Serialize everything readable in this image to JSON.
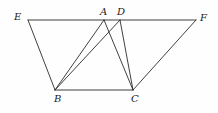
{
  "figure": {
    "type": "geometry-diagram",
    "title": "",
    "background_color": "#fefefe",
    "stroke_color": "#2b2b2b",
    "stroke_width": 0.9,
    "width": 218,
    "height": 113,
    "points": {
      "E": {
        "label": "E",
        "x": 28,
        "y": 20,
        "label_x": 14,
        "label_y": 12
      },
      "A": {
        "label": "A",
        "x": 104,
        "y": 20,
        "label_x": 100,
        "label_y": 7
      },
      "D": {
        "label": "D",
        "x": 120,
        "y": 20,
        "label_x": 117,
        "label_y": 7
      },
      "F": {
        "label": "F",
        "x": 196,
        "y": 20,
        "label_x": 200,
        "label_y": 13
      },
      "B": {
        "label": "B",
        "x": 55,
        "y": 90,
        "label_x": 54,
        "label_y": 94
      },
      "C": {
        "label": "C",
        "x": 133,
        "y": 90,
        "label_x": 131,
        "label_y": 94
      }
    },
    "segments": [
      {
        "name": "segment-EF",
        "from": "E",
        "to": "F"
      },
      {
        "name": "segment-EB",
        "from": "E",
        "to": "B"
      },
      {
        "name": "segment-BC",
        "from": "B",
        "to": "C"
      },
      {
        "name": "segment-CF",
        "from": "C",
        "to": "F"
      },
      {
        "name": "segment-AB",
        "from": "A",
        "to": "B"
      },
      {
        "name": "segment-AC",
        "from": "A",
        "to": "C"
      },
      {
        "name": "segment-DB",
        "from": "D",
        "to": "B"
      },
      {
        "name": "segment-DC",
        "from": "D",
        "to": "C"
      }
    ]
  }
}
